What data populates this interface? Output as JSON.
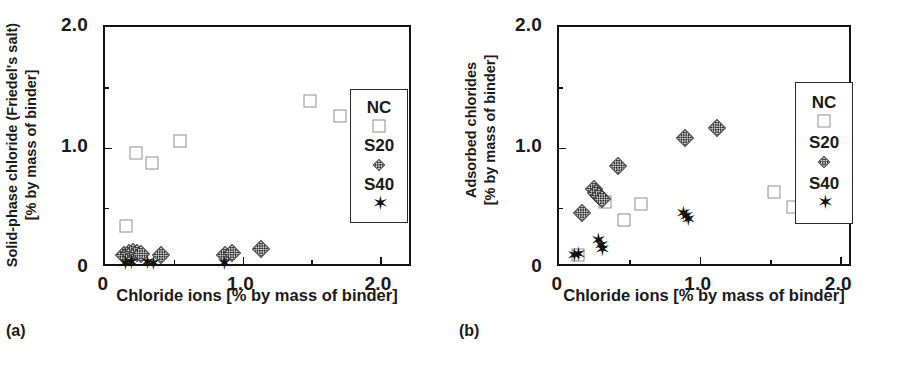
{
  "figure": {
    "panels": [
      {
        "id": "a",
        "caption": "(a)",
        "chart": {
          "type": "scatter",
          "title": "",
          "xlabel": "Chloride ions [% by mass of binder]",
          "ylabel_line1": "Solid-phase chloride (Friedel's salt)",
          "ylabel_line2": "[% by mass of binder]",
          "xlim": [
            0,
            2.24
          ],
          "ylim": [
            0,
            2.0
          ],
          "xticks": [
            0,
            1.0,
            2.0
          ],
          "xticklabels": [
            "0",
            "1.0",
            "2.0"
          ],
          "xminorticks": [
            0.5,
            1.5
          ],
          "yticks": [
            0,
            1.0,
            2.0
          ],
          "yticklabels": [
            "0",
            "1.0",
            "2.0"
          ],
          "yminorticks": [
            0.5,
            1.5
          ],
          "grid": false,
          "legend_position": "right-inside",
          "series": [
            {
              "name": "NC",
              "marker": "open-square",
              "points": [
                [
                  0.155,
                  0.345
                ],
                [
                  0.225,
                  0.955
                ],
                [
                  0.345,
                  0.875
                ],
                [
                  0.545,
                  1.055
                ],
                [
                  1.49,
                  1.385
                ],
                [
                  1.71,
                  1.265
                ]
              ]
            },
            {
              "name": "S20",
              "marker": "gray-diamond",
              "points": [
                [
                  0.135,
                  0.105
                ],
                [
                  0.175,
                  0.125
                ],
                [
                  0.205,
                  0.135
                ],
                [
                  0.235,
                  0.125
                ],
                [
                  0.265,
                  0.115
                ],
                [
                  0.41,
                  0.105
                ],
                [
                  0.875,
                  0.105
                ],
                [
                  0.925,
                  0.125
                ],
                [
                  1.135,
                  0.155
                ]
              ]
            },
            {
              "name": "S40",
              "marker": "black-star",
              "points": [
                [
                  0.145,
                  0.045
                ],
                [
                  0.185,
                  0.05
                ],
                [
                  0.305,
                  0.05
                ],
                [
                  0.345,
                  0.045
                ],
                [
                  0.865,
                  0.04
                ]
              ]
            }
          ]
        }
      },
      {
        "id": "b",
        "caption": "(b)",
        "chart": {
          "type": "scatter",
          "title": "",
          "xlabel": "Chloride ions [% by mass of binder]",
          "ylabel_line1": "Adsorbed chlorides",
          "ylabel_line2": "[% by mass of binder]",
          "xlim": [
            0,
            2.09
          ],
          "ylim": [
            0,
            2.0
          ],
          "xticks": [
            0,
            1.0,
            2.0
          ],
          "xticklabels": [
            "0",
            "1.0",
            "2.0"
          ],
          "xminorticks": [
            0.5,
            1.5
          ],
          "yticks": [
            0,
            1.0,
            2.0
          ],
          "yticklabels": [
            "0",
            "1.0",
            "2.0"
          ],
          "yminorticks": [
            0.5,
            1.5
          ],
          "grid": false,
          "legend_position": "right-inside",
          "series": [
            {
              "name": "NC",
              "marker": "open-square",
              "points": [
                [
                  0.135,
                  0.105
                ],
                [
                  0.33,
                  0.545
                ],
                [
                  0.46,
                  0.395
                ],
                [
                  0.585,
                  0.53
                ],
                [
                  1.53,
                  0.63
                ],
                [
                  1.665,
                  0.505
                ]
              ]
            },
            {
              "name": "S20",
              "marker": "gray-diamond",
              "points": [
                [
                  0.165,
                  0.455
                ],
                [
                  0.25,
                  0.655
                ],
                [
                  0.265,
                  0.625
                ],
                [
                  0.285,
                  0.6
                ],
                [
                  0.305,
                  0.575
                ],
                [
                  0.42,
                  0.845
                ],
                [
                  0.895,
                  1.075
                ],
                [
                  1.125,
                  1.165
                ]
              ]
            },
            {
              "name": "S40",
              "marker": "black-star",
              "points": [
                [
                  0.105,
                  0.11
                ],
                [
                  0.135,
                  0.115
                ],
                [
                  0.275,
                  0.235
                ],
                [
                  0.295,
                  0.195
                ],
                [
                  0.305,
                  0.16
                ],
                [
                  0.875,
                  0.455
                ],
                [
                  0.9,
                  0.43
                ],
                [
                  0.915,
                  0.41
                ]
              ]
            }
          ]
        }
      }
    ]
  }
}
